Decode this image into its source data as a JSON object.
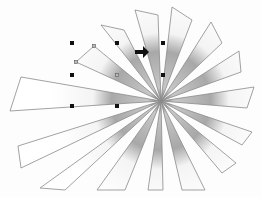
{
  "canvas": {
    "background": "#fdfdfd",
    "top_strip_text": "",
    "shape": {
      "type": "sunburst",
      "center": [
        161,
        101
      ],
      "stroke_color": "#8a8a8a",
      "gradient_color": "#9a9a9a",
      "rays": [
        {
          "name": "ray-top-1",
          "outer": [
            [
              101,
              25
            ],
            [
              124,
              30
            ]
          ]
        },
        {
          "name": "ray-top-2",
          "outer": [
            [
              135,
              10
            ],
            [
              158,
              15
            ]
          ]
        },
        {
          "name": "ray-top-3",
          "outer": [
            [
              172,
              7
            ],
            [
              192,
              20
            ]
          ]
        },
        {
          "name": "ray-top-4",
          "outer": [
            [
              211,
              22
            ],
            [
              222,
              43
            ]
          ]
        },
        {
          "name": "ray-right-1",
          "outer": [
            [
              239,
              51
            ],
            [
              241,
              72
            ]
          ]
        },
        {
          "name": "ray-right-2",
          "outer": [
            [
              254,
              87
            ],
            [
              247,
              108
            ]
          ]
        },
        {
          "name": "ray-right-3",
          "outer": [
            [
              252,
              132
            ],
            [
              242,
              145
            ]
          ]
        },
        {
          "name": "ray-bottom-right-1",
          "outer": [
            [
              236,
              163
            ],
            [
              222,
              173
            ]
          ]
        },
        {
          "name": "ray-bottom-1",
          "outer": [
            [
              205,
              190
            ],
            [
              182,
              190
            ]
          ]
        },
        {
          "name": "ray-bottom-2",
          "outer": [
            [
              163,
              190
            ],
            [
              148,
              190
            ]
          ]
        },
        {
          "name": "ray-bottom-3",
          "outer": [
            [
              125,
              190
            ],
            [
              97,
              190
            ]
          ]
        },
        {
          "name": "ray-bottom-left-1",
          "outer": [
            [
              65,
              190
            ],
            [
              40,
              188
            ]
          ]
        },
        {
          "name": "ray-left-1",
          "outer": [
            [
              21,
              168
            ],
            [
              18,
              146
            ]
          ]
        },
        {
          "name": "ray-left-2",
          "outer": [
            [
              10,
              111
            ],
            [
              21,
              77
            ]
          ]
        },
        {
          "name": "ray-selected",
          "outer": [
            [
              76,
              62
            ],
            [
              94,
              46
            ]
          ]
        }
      ]
    },
    "selection": {
      "handles": [
        [
          72,
          43
        ],
        [
          117,
          43
        ],
        [
          163,
          43
        ],
        [
          72,
          75
        ],
        [
          163,
          75
        ],
        [
          72,
          106
        ],
        [
          117,
          106
        ]
      ],
      "vertex_handles": [
        [
          94,
          46
        ],
        [
          76,
          62
        ],
        [
          117,
          75
        ]
      ]
    },
    "cursor": {
      "type": "arrow-right",
      "position": [
        135,
        48
      ]
    }
  }
}
